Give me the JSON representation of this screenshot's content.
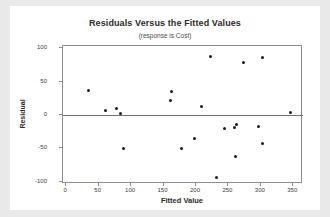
{
  "chart_data": {
    "type": "scatter",
    "title": "Residuals Versus the Fitted Values",
    "subtitle": "(response is Cost)",
    "xlabel": "Fitted Value",
    "ylabel": "Residual",
    "xlim": [
      -5,
      365
    ],
    "ylim": [
      -103,
      103
    ],
    "grid": false,
    "legend": null,
    "xticks": [
      0,
      50,
      100,
      150,
      200,
      250,
      300,
      350
    ],
    "yticks": [
      100,
      50,
      0,
      -50,
      -100
    ],
    "xtick_labels": [
      "0",
      "50",
      "100",
      "150",
      "200",
      "250",
      "300",
      "350"
    ],
    "ytick_labels": [
      "100",
      "50",
      "0",
      "-50",
      "-100"
    ],
    "reference_line": 0,
    "marker": "filled-circle",
    "marker_color": "#1c1c1c",
    "points": [
      {
        "x": 34,
        "y": 37
      },
      {
        "x": 61,
        "y": 7
      },
      {
        "x": 77,
        "y": 9
      },
      {
        "x": 83,
        "y": 2
      },
      {
        "x": 88,
        "y": -50
      },
      {
        "x": 162,
        "y": 35
      },
      {
        "x": 160,
        "y": 22
      },
      {
        "x": 177,
        "y": -50
      },
      {
        "x": 198,
        "y": -35
      },
      {
        "x": 209,
        "y": 13
      },
      {
        "x": 222,
        "y": 87
      },
      {
        "x": 231,
        "y": -93
      },
      {
        "x": 244,
        "y": -20
      },
      {
        "x": 259,
        "y": -19
      },
      {
        "x": 261,
        "y": -62
      },
      {
        "x": 263,
        "y": -14
      },
      {
        "x": 274,
        "y": 79
      },
      {
        "x": 297,
        "y": -17
      },
      {
        "x": 303,
        "y": 86
      },
      {
        "x": 303,
        "y": -42
      },
      {
        "x": 345,
        "y": 4
      }
    ]
  },
  "colors": {
    "background": "#e9e9e9",
    "card": "#ffffff",
    "axis": "#8d8d8d",
    "text": "#2b2b2b",
    "marker": "#1c1c1c"
  }
}
